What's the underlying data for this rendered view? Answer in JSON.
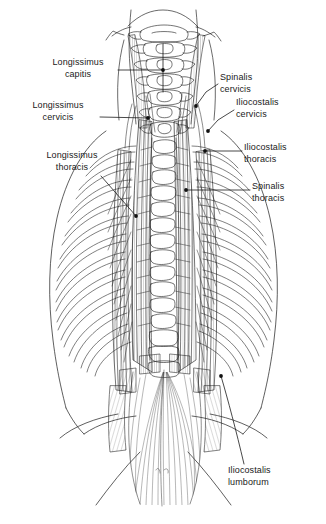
{
  "figure": {
    "view": "posterior",
    "background_color": "#ffffff",
    "line_color": "#1a1a1a",
    "label_color": "#1a1a1a"
  },
  "labels": [
    {
      "id": "longissimus-capitis",
      "line1": "Longissimus",
      "line2": "capitis",
      "side": "left",
      "x": 38,
      "y": 57,
      "w": 80,
      "align": "center",
      "leader": "M118,70 H163 M163,70 V44 M163,70 L163,92",
      "target_x": 163,
      "target_y": 70
    },
    {
      "id": "longissimus-cervicis",
      "line1": "Longissimus",
      "line2": "cervicis",
      "side": "left",
      "x": 18,
      "y": 100,
      "w": 80,
      "align": "center",
      "leader": "M100,117 L148,118",
      "target_x": 148,
      "target_y": 118
    },
    {
      "id": "longissimus-thoracis",
      "line1": "Longissimus",
      "line2": "thoracis",
      "side": "left",
      "x": 30,
      "y": 150,
      "w": 84,
      "align": "center",
      "leader": "M101,176 L136,216",
      "target_x": 136,
      "target_y": 216
    },
    {
      "id": "spinalis-cervicis",
      "line1": "Spinalis",
      "line2": "cervicis",
      "side": "right",
      "x": 220,
      "y": 72,
      "w": 52,
      "align": "left",
      "leader": "M218,84 L206,92 L196,106",
      "target_x": 196,
      "target_y": 106
    },
    {
      "id": "iliocostalis-cervicis",
      "line1": "Iliocostalis",
      "line2": "cervicis",
      "side": "right",
      "x": 236,
      "y": 97,
      "w": 62,
      "align": "left",
      "leader": "M234,110 L218,120 L208,131",
      "target_x": 208,
      "target_y": 131
    },
    {
      "id": "iliocostalis-thoracis",
      "line1": "Iliocostalis",
      "line2": "thoracis",
      "side": "right",
      "x": 244,
      "y": 142,
      "w": 66,
      "align": "left",
      "leader": "M242,151 H205",
      "target_x": 205,
      "target_y": 151
    },
    {
      "id": "spinalis-thoracis",
      "line1": "Spinalis",
      "line2": "thoracis",
      "side": "right",
      "x": 252,
      "y": 181,
      "w": 56,
      "align": "left",
      "leader": "M250,190 H186",
      "target_x": 186,
      "target_y": 190
    },
    {
      "id": "iliocostalis-lumborum",
      "line1": "Iliocostalis",
      "line2": "lumborum",
      "side": "right",
      "x": 228,
      "y": 465,
      "w": 70,
      "align": "left",
      "leader": "M244,464 C236,430 228,400 221,376",
      "target_x": 221,
      "target_y": 376
    }
  ],
  "anatomy": {
    "regions": [
      "cervical vertebrae",
      "thoracic vertebrae",
      "rib cage",
      "lumbar region",
      "thoracolumbar aponeurosis",
      "iliac crest"
    ],
    "muscles": [
      "Longissimus capitis",
      "Longissimus cervicis",
      "Longissimus thoracis",
      "Spinalis cervicis",
      "Spinalis thoracis",
      "Iliocostalis cervicis",
      "Iliocostalis thoracis",
      "Iliocostalis lumborum"
    ],
    "rib_pair_count": 12,
    "cervical_vertebra_count": 7
  }
}
